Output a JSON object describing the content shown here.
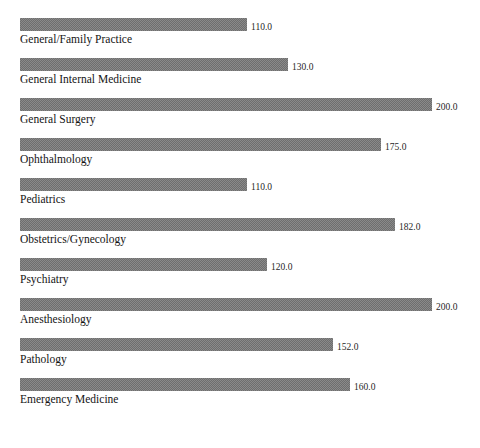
{
  "chart_data": {
    "type": "bar",
    "orientation": "horizontal",
    "title": "",
    "xlabel": "",
    "ylabel": "",
    "xlim": [
      0,
      200
    ],
    "grid": false,
    "legend": false,
    "value_label_format": "one-decimal",
    "bar_fill": "#8a8a8a",
    "background": "#ffffff",
    "categories": [
      "General/Family Practice",
      "General Internal Medicine",
      "General Surgery",
      "Ophthalmology",
      "Pediatrics",
      "Obstetrics/Gynecology",
      "Psychiatry",
      "Anesthesiology",
      "Pathology",
      "Emergency Medicine"
    ],
    "values": [
      110.0,
      130.0,
      200.0,
      175.0,
      110.0,
      182.0,
      120.0,
      200.0,
      152.0,
      160.0
    ],
    "value_labels": [
      "110.0",
      "130.0",
      "200.0",
      "175.0",
      "110.0",
      "182.0",
      "120.0",
      "200.0",
      "152.0",
      "160.0"
    ]
  }
}
